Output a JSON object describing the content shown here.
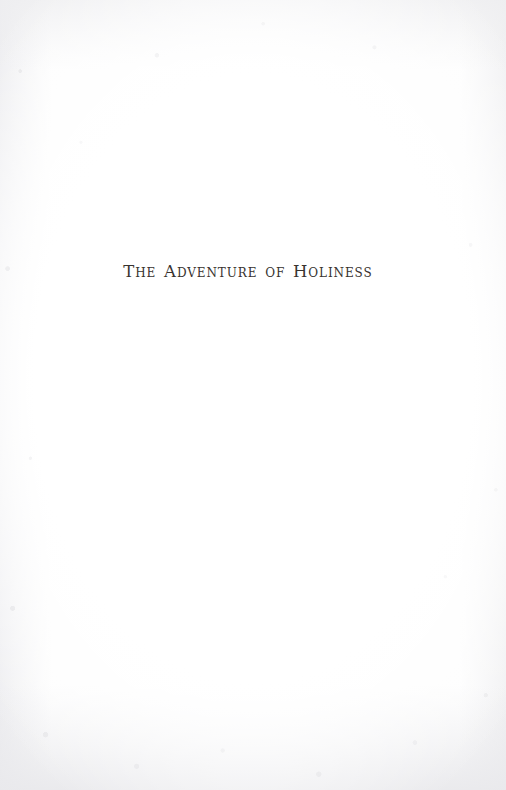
{
  "document": {
    "kind": "book-part-title-page",
    "page_background_color": "#fdfdfd",
    "ink_color": "#38332f"
  },
  "title_block": {
    "part_title": "The Adventure of Holiness"
  }
}
